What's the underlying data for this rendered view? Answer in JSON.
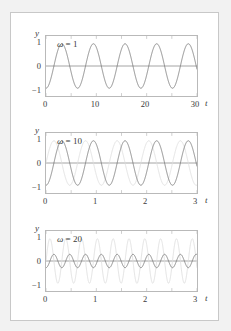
{
  "figure": {
    "background_color": "#ffffff",
    "page_color": "#f2f2f2",
    "border_color": "#c8c8c8",
    "axis_color": "#b9b9b9",
    "curve_dark_color": "#6e6e6e",
    "curve_light_color": "#dcdcdc",
    "zero_line_color": "#8a8a8a"
  },
  "panels": [
    {
      "omega_symbol": "ω",
      "omega_equals": " = ",
      "omega_value": "1",
      "y_name": "y",
      "x_name": "t",
      "y_ticks": [
        "1",
        "0",
        "−1"
      ],
      "x_ticks": [
        "0",
        "10",
        "20",
        "30"
      ]
    },
    {
      "omega_symbol": "ω",
      "omega_equals": " = ",
      "omega_value": "10",
      "y_name": "y",
      "x_name": "t",
      "y_ticks": [
        "1",
        "0",
        "−1"
      ],
      "x_ticks": [
        "0",
        "1",
        "2",
        "3"
      ]
    },
    {
      "omega_symbol": "ω",
      "omega_equals": " = ",
      "omega_value": "20",
      "y_name": "y",
      "x_name": "t",
      "y_ticks": [
        "1",
        "0",
        "−1"
      ],
      "x_ticks": [
        "0",
        "1",
        "2",
        "3"
      ]
    }
  ],
  "chart_data": [
    {
      "type": "line",
      "title": "ω = 1",
      "xlabel": "t",
      "ylabel": "y",
      "xlim": [
        0,
        30
      ],
      "ylim": [
        -1.35,
        1.35
      ],
      "xticks": [
        0,
        10,
        20,
        30
      ],
      "yticks": [
        -1,
        0,
        1
      ],
      "grid": false,
      "legend": "none",
      "series": [
        {
          "name": "response",
          "color": "#6e6e6e",
          "amplitude": 1.0,
          "angular_frequency": 1.0,
          "phase": -1.5708,
          "comment": "y = sin(t - pi/2)+... approx 5 cycles over t in [0,30]"
        }
      ]
    },
    {
      "type": "line",
      "title": "ω = 10",
      "xlabel": "t",
      "ylabel": "y",
      "xlim": [
        0,
        3
      ],
      "ylim": [
        -1.35,
        1.35
      ],
      "xticks": [
        0,
        1,
        2,
        3
      ],
      "yticks": [
        -1,
        0,
        1
      ],
      "grid": false,
      "legend": "none",
      "series": [
        {
          "name": "driving",
          "color": "#dcdcdc",
          "amplitude": 1.0,
          "angular_frequency": 10.0,
          "phase": 0.0
        },
        {
          "name": "response",
          "color": "#6e6e6e",
          "amplitude": 1.0,
          "angular_frequency": 10.0,
          "phase": -1.5708
        }
      ]
    },
    {
      "type": "line",
      "title": "ω = 20",
      "xlabel": "t",
      "ylabel": "y",
      "xlim": [
        0,
        3
      ],
      "ylim": [
        -1.35,
        1.35
      ],
      "xticks": [
        0,
        1,
        2,
        3
      ],
      "yticks": [
        -1,
        0,
        1
      ],
      "grid": false,
      "legend": "none",
      "series": [
        {
          "name": "driving",
          "color": "#dcdcdc",
          "amplitude": 1.0,
          "angular_frequency": 20.0,
          "phase": 0.0
        },
        {
          "name": "response",
          "color": "#6e6e6e",
          "amplitude": 0.3,
          "angular_frequency": 20.0,
          "phase": -1.5708
        }
      ]
    }
  ]
}
